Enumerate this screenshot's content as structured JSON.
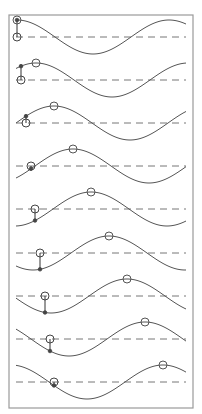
{
  "diagram": {
    "title": "",
    "frame": {
      "x": 9,
      "y": 15,
      "width": 184,
      "height": 393,
      "stroke": "#9a9a9a"
    },
    "wave": {
      "x_start": 16,
      "x_end": 186,
      "wavelength": 152,
      "amplitude": 17,
      "stroke": "#555555",
      "axis_stroke": "#777777",
      "axis_dash": "7,5"
    },
    "panels": [
      {
        "index": 1,
        "axis_y": 37,
        "crest_x": 17,
        "particle_x": 17
      },
      {
        "index": 2,
        "axis_y": 80,
        "crest_x": 36,
        "particle_x": 21
      },
      {
        "index": 3,
        "axis_y": 123,
        "crest_x": 54,
        "particle_x": 26
      },
      {
        "index": 4,
        "axis_y": 166,
        "crest_x": 73,
        "particle_x": 31
      },
      {
        "index": 5,
        "axis_y": 209,
        "crest_x": 91,
        "particle_x": 35
      },
      {
        "index": 6,
        "axis_y": 253,
        "crest_x": 109,
        "particle_x": 40
      },
      {
        "index": 7,
        "axis_y": 296,
        "crest_x": 127,
        "particle_x": 45
      },
      {
        "index": 8,
        "axis_y": 339,
        "crest_x": 145,
        "particle_x": 50
      },
      {
        "index": 9,
        "axis_y": 382,
        "crest_x": 163,
        "particle_x": 54
      }
    ]
  }
}
